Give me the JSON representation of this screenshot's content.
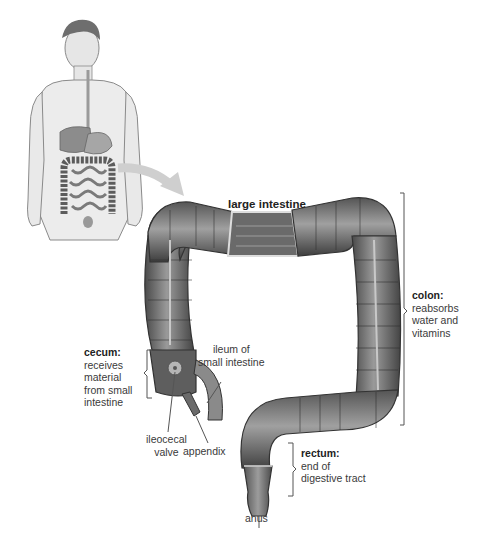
{
  "diagram": {
    "title": "large intestine",
    "overview_figure": "human torso showing digestive system",
    "labels": {
      "colon": {
        "term": "colon:",
        "description": [
          "reabsorbs",
          "water and",
          "vitamins"
        ]
      },
      "cecum": {
        "term": "cecum:",
        "description": [
          "receives",
          "material",
          "from small",
          "intestine"
        ]
      },
      "ileum": {
        "lines": [
          "ileum of",
          "small intestine"
        ]
      },
      "ileocecal_valve": {
        "lines": [
          "ileocecal",
          "valve"
        ]
      },
      "appendix": {
        "text": "appendix"
      },
      "rectum": {
        "term": "rectum:",
        "description": [
          "end of",
          "digestive tract"
        ]
      },
      "anus": {
        "text": "anus"
      }
    },
    "colors": {
      "organ_dark": "#5a5a5a",
      "organ_mid": "#8a8a8a",
      "organ_light": "#bdbdbd",
      "skin": "#e2e2e2",
      "line": "#555555"
    }
  }
}
